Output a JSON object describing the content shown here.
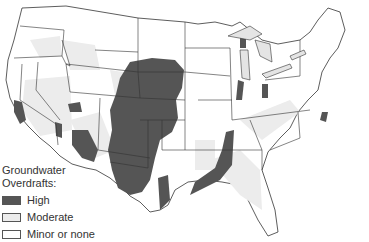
{
  "map": {
    "region": "Contiguous United States",
    "colors": {
      "high": "#555555",
      "moderate": "#ececec",
      "minor_or_none": "#ffffff",
      "border": "#333333"
    }
  },
  "legend": {
    "title_line1": "Groundwater",
    "title_line2": "Overdrafts:",
    "items": [
      {
        "label": "High",
        "color": "#555555"
      },
      {
        "label": "Moderate",
        "color": "#ececec"
      },
      {
        "label": "Minor or none",
        "color": "#ffffff"
      }
    ]
  }
}
